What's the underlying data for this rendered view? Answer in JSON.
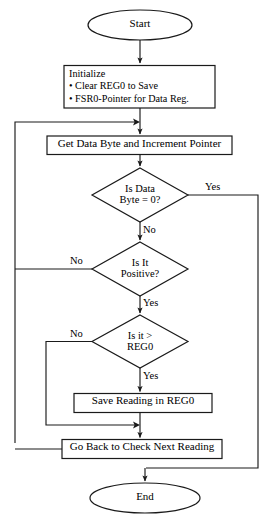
{
  "diagram": {
    "stroke_color": "#1a1a1a",
    "fill_color": "#ffffff",
    "text_color": "#000000"
  },
  "nodes": {
    "start": {
      "label": "Start",
      "shape": "terminator"
    },
    "initialize": {
      "heading": "Initialize",
      "bullet1": "• Clear REG0 to Save",
      "bullet2": "• FSR0-Pointer for Data Reg.",
      "shape": "process"
    },
    "get_byte": {
      "label": "Get Data Byte and Increment Pointer",
      "shape": "process"
    },
    "is_zero": {
      "line1": "Is Data",
      "line2": "Byte = 0?",
      "shape": "decision"
    },
    "is_positive": {
      "line1": "Is It",
      "line2": "Positive?",
      "shape": "decision"
    },
    "is_greater": {
      "line1": "Is it >",
      "line2": "REG0",
      "shape": "decision"
    },
    "save_reading": {
      "label": "Save Reading in REG0",
      "shape": "process"
    },
    "go_back": {
      "label": "Go Back to Check Next Reading",
      "shape": "process"
    },
    "end": {
      "label": "End",
      "shape": "terminator"
    }
  },
  "edge_labels": {
    "zero_yes": "Yes",
    "zero_no": "No",
    "positive_no": "No",
    "positive_yes": "Yes",
    "greater_no": "No",
    "greater_yes": "Yes"
  }
}
